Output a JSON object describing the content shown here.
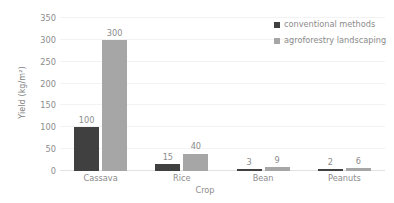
{
  "chart_data": {
    "type": "bar",
    "title": "",
    "subtitle": "",
    "xlabel": "Crop",
    "ylabel": "Yield (kg/m²)",
    "categories": [
      "Cassava",
      "Rice",
      "Bean",
      "Peanuts"
    ],
    "series": [
      {
        "name": "conventional methods",
        "color": "#404040",
        "values": [
          100,
          15,
          3,
          2
        ]
      },
      {
        "name": "agroforestry landscaping",
        "color": "#a6a6a6",
        "values": [
          300,
          40,
          9,
          6
        ]
      }
    ],
    "ylim": [
      0,
      350
    ],
    "yticks": [
      0,
      50,
      100,
      150,
      200,
      250,
      300,
      350
    ],
    "ytick_labels": [
      "0",
      "50",
      "100",
      "150",
      "200",
      "250",
      "300",
      "350"
    ],
    "data_labels": [
      [
        "100",
        "15",
        "3",
        "2"
      ],
      [
        "300",
        "40",
        "9",
        "6"
      ]
    ],
    "grid": "horizontal",
    "grid_color": "#f2f2f2",
    "legend_position": "top-right",
    "background": "#ffffff",
    "text_color": "#8c8c8c"
  },
  "legend": {
    "entries": [
      {
        "label": "conventional methods"
      },
      {
        "label": "agroforestry landscaping"
      }
    ]
  },
  "axes": {
    "y_title": "Yield (kg/m²)",
    "x_title": "Crop"
  }
}
